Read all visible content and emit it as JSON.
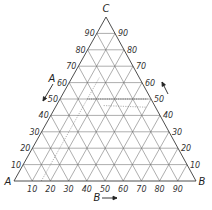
{
  "diagram": {
    "type": "ternary",
    "vertices": {
      "A": {
        "label": "A",
        "x": 14,
        "y": 181
      },
      "B": {
        "label": "B",
        "x": 196,
        "y": 181
      },
      "C": {
        "label": "C",
        "x": 106,
        "y": 17
      }
    },
    "grid_step": 10,
    "ticks": {
      "left_edge_A": [
        "10",
        "20",
        "30",
        "40",
        "50",
        "60",
        "70",
        "80",
        "90"
      ],
      "right_edge_C": [
        "90",
        "80",
        "70",
        "60",
        "50",
        "40",
        "30",
        "20",
        "10"
      ],
      "bottom_edge_B": [
        "10",
        "20",
        "30",
        "40",
        "50",
        "60",
        "70",
        "80",
        "90"
      ]
    },
    "axis_arrows": {
      "A": {
        "label": "A",
        "direction": "down-left"
      },
      "B": {
        "label": "B",
        "direction": "right"
      },
      "C": {
        "label": "",
        "direction": "up-left"
      }
    },
    "guide_lines": [
      {
        "style": "dotted-heavy",
        "description": "horizontal at C=50",
        "from": [
          0.35,
          0.15,
          0.5
        ],
        "to": [
          0.02,
          0.48,
          0.5
        ]
      },
      {
        "style": "dotted",
        "description": "parallel to A-C edge at B≈15",
        "from": [
          0.85,
          0.15,
          0.0
        ],
        "to": [
          0.22,
          0.15,
          0.63
        ]
      },
      {
        "style": "dotted",
        "description": "near-vertical inner guide",
        "from": [
          0.28,
          0.26,
          0.46
        ],
        "to": [
          0.05,
          0.5,
          0.45
        ]
      }
    ]
  }
}
